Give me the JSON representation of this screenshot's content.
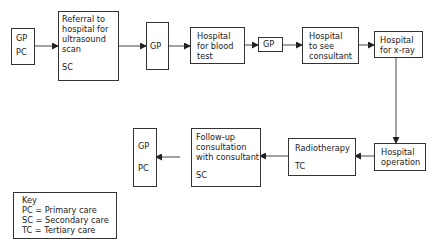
{
  "diagram": {
    "type": "flowchart",
    "nodes": [
      {
        "id": "gp1",
        "lines": [
          "GP"
        ],
        "code": "PC"
      },
      {
        "id": "referral",
        "lines": [
          "Referral to",
          "hospital for",
          "ultrasound",
          "scan"
        ],
        "code": "SC"
      },
      {
        "id": "gp2",
        "lines": [
          "GP"
        ],
        "code": ""
      },
      {
        "id": "blood",
        "lines": [
          "Hospital",
          "for blood",
          "test"
        ],
        "code": ""
      },
      {
        "id": "gp3",
        "lines": [
          "GP"
        ],
        "code": ""
      },
      {
        "id": "consultant",
        "lines": [
          "Hospital",
          "to see",
          "consultant"
        ],
        "code": ""
      },
      {
        "id": "xray",
        "lines": [
          "Hospital",
          "for x-ray"
        ],
        "code": ""
      },
      {
        "id": "operation",
        "lines": [
          "Hospital",
          "operation"
        ],
        "code": ""
      },
      {
        "id": "radiotherapy",
        "lines": [
          "Radiotherapy"
        ],
        "code": "TC"
      },
      {
        "id": "followup",
        "lines": [
          "Follow-up",
          "consultation",
          "with consultant"
        ],
        "code": "SC"
      },
      {
        "id": "gp4",
        "lines": [
          "GP"
        ],
        "code": "PC"
      }
    ],
    "edges": [
      [
        "gp1",
        "referral"
      ],
      [
        "referral",
        "gp2"
      ],
      [
        "gp2",
        "blood"
      ],
      [
        "blood",
        "gp3"
      ],
      [
        "gp3",
        "consultant"
      ],
      [
        "consultant",
        "xray"
      ],
      [
        "xray",
        "operation"
      ],
      [
        "operation",
        "radiotherapy"
      ],
      [
        "radiotherapy",
        "followup"
      ],
      [
        "followup",
        "gp4"
      ]
    ],
    "key": {
      "title": "Key",
      "entries": [
        "PC = Primary care",
        "SC = Secondary care",
        "TC = Tertiary care"
      ]
    }
  }
}
